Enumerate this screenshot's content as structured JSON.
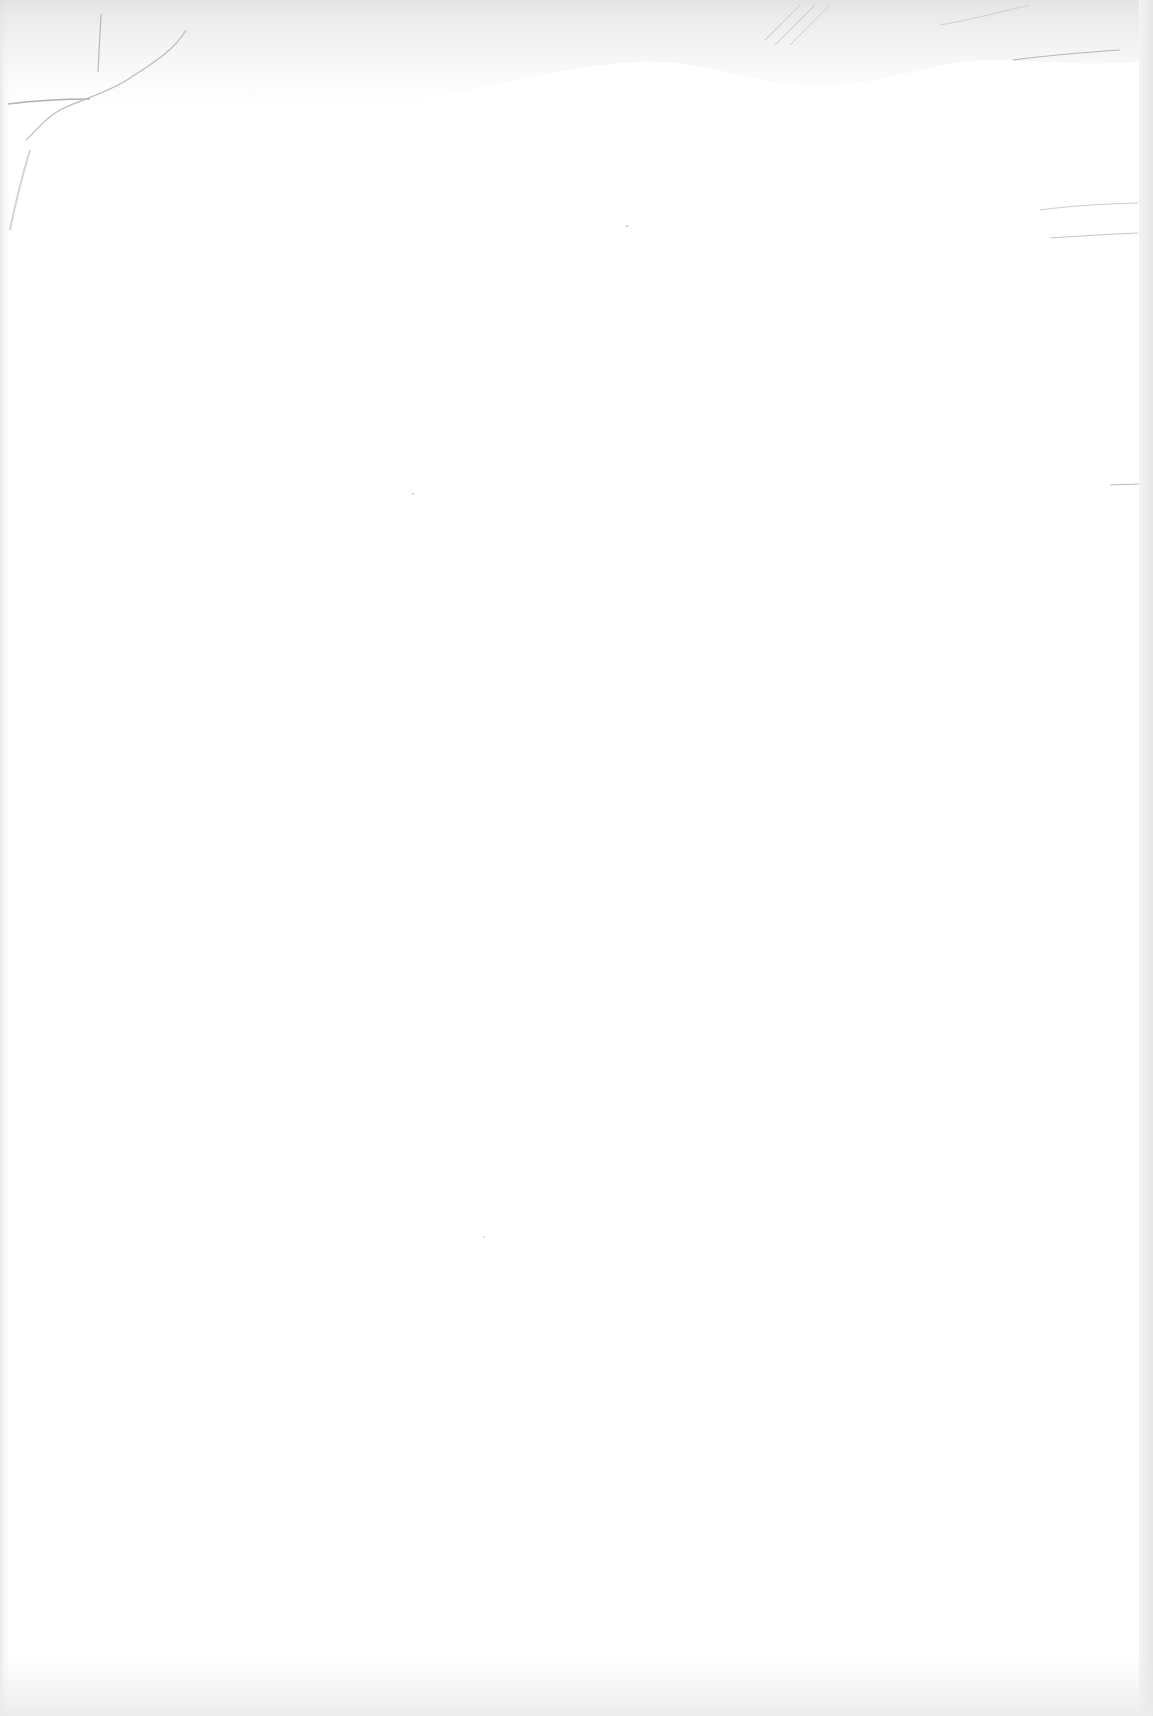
{
  "document": {
    "type": "blank scanned page",
    "text_content": [],
    "colors": {
      "paper": "#ffffff",
      "edge_shadow": "#e6e6e6",
      "crease": "#b8b8b8",
      "smudge": "#c8c8c8"
    }
  }
}
